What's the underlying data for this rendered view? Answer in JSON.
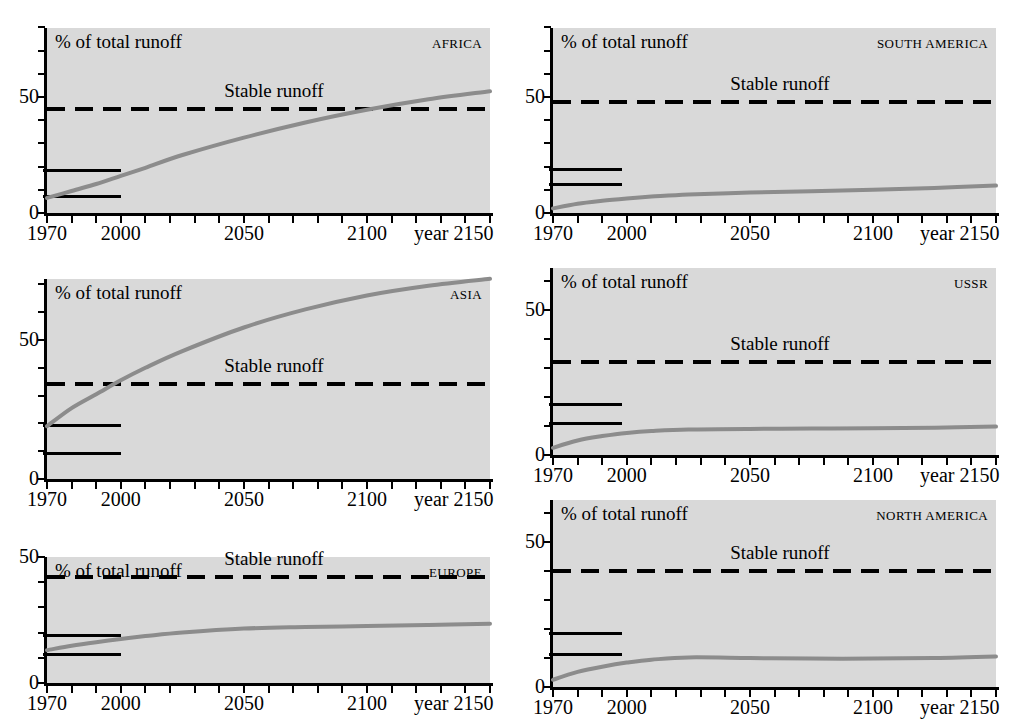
{
  "figure": {
    "axis_title": "% of total runoff",
    "stable_label": "Stable runoff",
    "x_axis_label": "year 2150",
    "y_tick_labels": [
      "0",
      "50"
    ],
    "x_tick_labels": [
      "1970",
      "2000",
      "2050",
      "2100"
    ],
    "background_color": "#d9d9d9",
    "curve_color": "#8c8c8c",
    "line_color": "#000000",
    "x_range": [
      1970,
      2150
    ],
    "x_minor_tick_step": 10
  },
  "chart_data": {
    "type": "line",
    "xlabel": "year",
    "ylabel": "% of total runoff",
    "xlim": [
      1970,
      2150
    ],
    "grid": false,
    "legend": "none",
    "annotations": [
      "Stable runoff"
    ],
    "panels": [
      {
        "region": "AFRICA",
        "ylim": [
          0,
          75
        ],
        "y_ticks": [
          0,
          50
        ],
        "stable_runoff": 45.0,
        "historic_bars": [
          {
            "value": 18.5,
            "from": 1970,
            "to": 2000
          },
          {
            "value": 7.3,
            "from": 1970,
            "to": 2000
          }
        ],
        "x": [
          1970,
          1980,
          1990,
          2000,
          2010,
          2025,
          2050,
          2075,
          2100,
          2125,
          2150
        ],
        "y": [
          6.5,
          9.5,
          12.5,
          16.0,
          19.5,
          25.0,
          32.5,
          39.0,
          44.5,
          49.0,
          52.5
        ]
      },
      {
        "region": "SOUTH AMERICA",
        "ylim": [
          0,
          75
        ],
        "y_ticks": [
          0,
          50
        ],
        "stable_runoff": 48.0,
        "historic_bars": [
          {
            "value": 19.0,
            "from": 1970,
            "to": 1998
          },
          {
            "value": 12.5,
            "from": 1970,
            "to": 1998
          }
        ],
        "x": [
          1970,
          1980,
          1990,
          2000,
          2010,
          2025,
          2050,
          2075,
          2100,
          2125,
          2150
        ],
        "y": [
          2.0,
          4.0,
          5.3,
          6.3,
          7.1,
          8.0,
          8.8,
          9.4,
          10.0,
          10.8,
          11.8
        ]
      },
      {
        "region": "ASIA",
        "ylim": [
          0,
          82
        ],
        "y_ticks": [
          0,
          50
        ],
        "stable_runoff": 34.0,
        "historic_bars": [
          {
            "value": 19.5,
            "from": 1970,
            "to": 2000
          },
          {
            "value": 9.5,
            "from": 1970,
            "to": 2000
          }
        ],
        "x": [
          1970,
          1980,
          1990,
          2000,
          2010,
          2025,
          2050,
          2075,
          2100,
          2125,
          2150
        ],
        "y": [
          19.0,
          25.5,
          30.5,
          35.5,
          40.0,
          46.0,
          54.5,
          61.0,
          66.0,
          69.5,
          72.0
        ]
      },
      {
        "region": "USSR",
        "ylim": [
          0,
          63
        ],
        "y_ticks": [
          0,
          50
        ],
        "stable_runoff": 32.0,
        "historic_bars": [
          {
            "value": 17.5,
            "from": 1970,
            "to": 1998
          },
          {
            "value": 11.0,
            "from": 1970,
            "to": 1998
          }
        ],
        "x": [
          1970,
          1980,
          1990,
          2000,
          2010,
          2025,
          2050,
          2075,
          2100,
          2125,
          2150
        ],
        "y": [
          2.5,
          5.0,
          6.5,
          7.6,
          8.3,
          8.8,
          9.0,
          9.1,
          9.2,
          9.4,
          9.8
        ]
      },
      {
        "region": "EUROPE",
        "ylim": [
          0,
          50
        ],
        "y_ticks": [
          0,
          50
        ],
        "stable_runoff": 42.0,
        "historic_bars": [
          {
            "value": 19.0,
            "from": 1970,
            "to": 2000
          },
          {
            "value": 11.5,
            "from": 1970,
            "to": 2000
          }
        ],
        "x": [
          1970,
          1980,
          1990,
          2000,
          2010,
          2025,
          2050,
          2075,
          2100,
          2125,
          2150
        ],
        "y": [
          13.0,
          14.8,
          16.2,
          17.5,
          18.6,
          20.0,
          21.6,
          22.2,
          22.6,
          23.0,
          23.5
        ]
      },
      {
        "region": "NORTH AMERICA",
        "ylim": [
          0,
          63
        ],
        "y_ticks": [
          0,
          50
        ],
        "stable_runoff": 40.0,
        "historic_bars": [
          {
            "value": 18.5,
            "from": 1970,
            "to": 1998
          },
          {
            "value": 11.5,
            "from": 1970,
            "to": 1998
          }
        ],
        "x": [
          1970,
          1980,
          1990,
          2000,
          2010,
          2025,
          2050,
          2075,
          2100,
          2125,
          2150
        ],
        "y": [
          2.5,
          5.2,
          7.0,
          8.4,
          9.4,
          10.2,
          10.0,
          9.8,
          9.8,
          10.0,
          10.5
        ]
      }
    ]
  }
}
